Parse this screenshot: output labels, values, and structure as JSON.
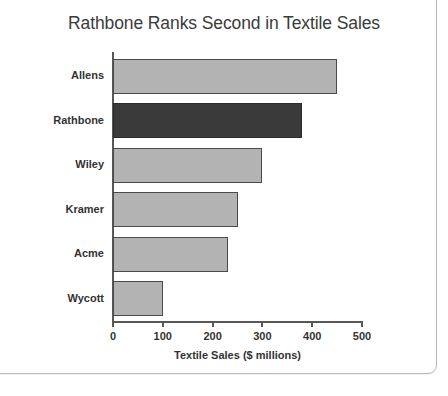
{
  "chart_data": {
    "type": "bar",
    "orientation": "horizontal",
    "title": "Rathbone Ranks Second in Textile Sales",
    "categories": [
      "Allens",
      "Rathbone",
      "Wiley",
      "Kramer",
      "Acme",
      "Wycott"
    ],
    "values": [
      450,
      380,
      300,
      250,
      230,
      100
    ],
    "highlight_category": "Rathbone",
    "xlabel": "Textile Sales ($ millions)",
    "ylabel": "",
    "xlim": [
      0,
      500
    ],
    "xticks": [
      0,
      100,
      200,
      300,
      400,
      500
    ],
    "xtick_labels": [
      "0",
      "100",
      "200",
      "300",
      "400",
      "500"
    ],
    "grid": false,
    "legend": false,
    "colors": {
      "bar": "#b3b3b3",
      "bar_highlight": "#3a3a3a",
      "bar_border": "#4a4a4a",
      "axis": "#585858",
      "text": "#333333",
      "title": "#3b3b3b",
      "background": "#ffffff",
      "card_border": "#b9b9b9"
    }
  }
}
